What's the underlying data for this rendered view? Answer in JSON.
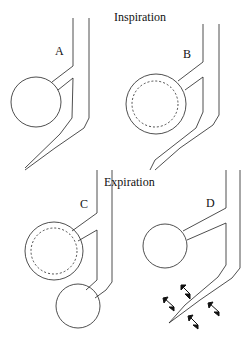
{
  "figure": {
    "headings": {
      "inspiration": "Inspiration",
      "expiration": "Expiration"
    },
    "panels": [
      {
        "id": "A",
        "label": "A",
        "description": "single sac, inflated, connected to airway"
      },
      {
        "id": "B",
        "label": "B",
        "description": "sac with dashed inner outline, airway tapering"
      },
      {
        "id": "C",
        "label": "C",
        "description": "sac with dashed inner outline plus second sac below"
      },
      {
        "id": "D",
        "label": "D",
        "description": "sac with airway compressed, arrows pointing inward"
      }
    ],
    "colors": {
      "line": "#222222",
      "background": "#ffffff"
    }
  }
}
